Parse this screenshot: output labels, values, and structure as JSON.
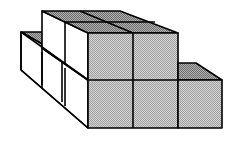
{
  "diagram": {
    "title": "",
    "colors": {
      "background": "#ffffff",
      "stroke": "#000000",
      "white_face": "#ffffff",
      "front_face": "#c8c8c8",
      "top_face": "#9a9a9a"
    },
    "cube_count_visible": 11
  }
}
